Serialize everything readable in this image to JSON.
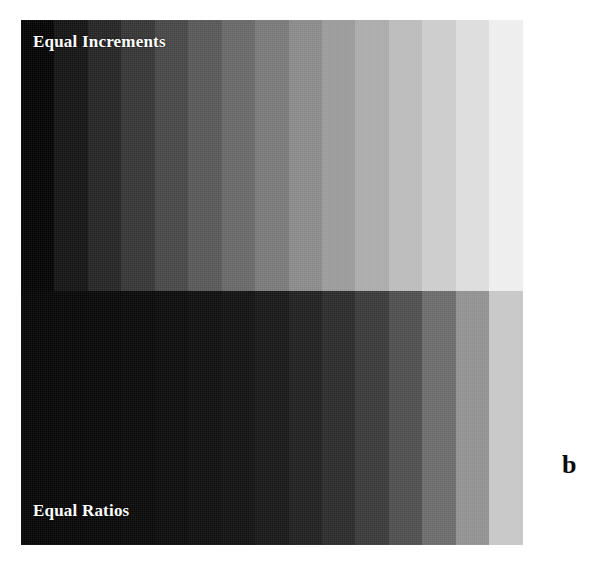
{
  "figure": {
    "letter": "b",
    "background_color": "#ffffff",
    "plate": {
      "left": 21,
      "top": 20,
      "width": 535,
      "height": 525
    }
  },
  "labels": {
    "top": "Equal Increments",
    "bottom": "Equal Ratios",
    "text_color": "#ffffff"
  },
  "chart_data": {
    "type": "heatmap",
    "xlabel": "",
    "ylabel": "",
    "grid": false,
    "legend_position": "none",
    "orientation": "horizontal-grayscale-ramp",
    "band_count": 16,
    "gray_range": [
      0,
      255
    ],
    "series": [
      {
        "name": "Equal Increments",
        "row": 0,
        "description": "Linear steps of equal luminance difference from black to white",
        "values": [
          0,
          17,
          34,
          51,
          68,
          85,
          102,
          119,
          136,
          153,
          170,
          187,
          204,
          221,
          238,
          255
        ],
        "colors": [
          "#000000",
          "#111111",
          "#222222",
          "#333333",
          "#444444",
          "#555555",
          "#666666",
          "#777777",
          "#888888",
          "#999999",
          "#aaaaaa",
          "#bbbbbb",
          "#cccccc",
          "#dddddd",
          "#eeeeee",
          "#ffffff"
        ]
      },
      {
        "name": "Equal Ratios",
        "row": 1,
        "description": "Geometric steps of constant luminance ratio from black to white",
        "values": [
          2,
          3,
          4,
          6,
          8,
          11,
          15,
          21,
          29,
          40,
          55,
          76,
          105,
          144,
          198,
          255
        ],
        "colors": [
          "#020202",
          "#030303",
          "#040404",
          "#060606",
          "#080808",
          "#0b0b0b",
          "#0f0f0f",
          "#151515",
          "#1d1d1d",
          "#282828",
          "#373737",
          "#4c4c4c",
          "#696969",
          "#909090",
          "#c6c6c6",
          "#ffffff"
        ]
      }
    ]
  }
}
